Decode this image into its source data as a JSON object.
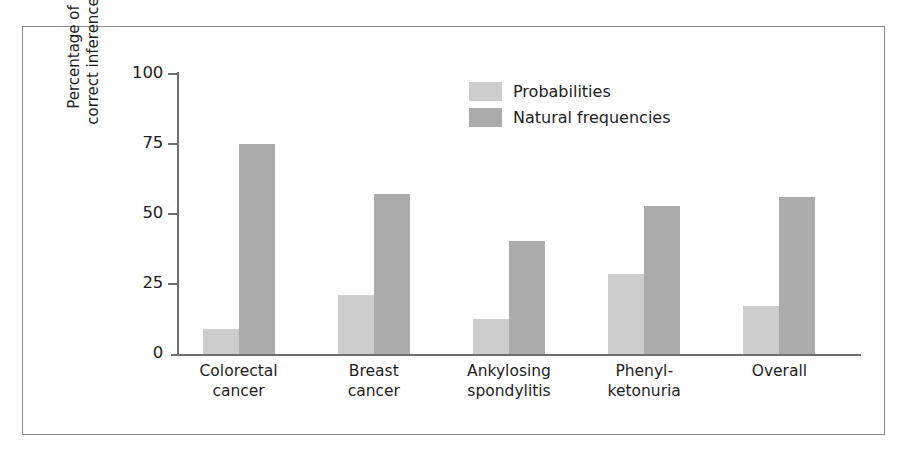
{
  "chart_data": {
    "type": "bar",
    "title": "",
    "xlabel": "",
    "ylabel": "Percentage of correct inferences",
    "ylabel_lines": [
      "Percentage of",
      "correct inferences"
    ],
    "ylim": [
      0,
      100
    ],
    "yticks": [
      0,
      25,
      50,
      75,
      100
    ],
    "ytick_labels": [
      "0",
      "25",
      "50",
      "75",
      "100"
    ],
    "grid": false,
    "legend_position": "inside-top-center",
    "categories": [
      "Colorectal cancer",
      "Breast cancer",
      "Ankylosing spondylitis",
      "Phenyl-ketonuria",
      "Overall"
    ],
    "category_lines": [
      [
        "Colorectal",
        "cancer"
      ],
      [
        "Breast",
        "cancer"
      ],
      [
        "Ankylosing",
        "spondylitis"
      ],
      [
        "Phenyl-",
        "ketonuria"
      ],
      [
        "Overall"
      ]
    ],
    "series": [
      {
        "name": "Probabilities",
        "color": "#cdcdcd",
        "values": [
          9,
          21,
          12.5,
          28.5,
          17
        ]
      },
      {
        "name": "Natural frequencies",
        "color": "#ababab",
        "values": [
          75,
          57,
          40.5,
          53,
          56
        ]
      }
    ]
  },
  "legend": {
    "items": [
      {
        "label": "Probabilities",
        "color": "#cdcdcd"
      },
      {
        "label": "Natural frequencies",
        "color": "#ababab"
      }
    ]
  },
  "colors": {
    "probabilities": "#cdcdcd",
    "natural_frequencies": "#ababab",
    "axis": "#6e6e6e",
    "frame": "#8a8a8a",
    "text": "#1d1d1d"
  }
}
